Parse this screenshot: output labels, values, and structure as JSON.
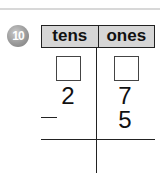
{
  "problem": {
    "number": "10",
    "headers": {
      "tens": "tens",
      "ones": "ones"
    },
    "rows": [
      {
        "tens": "",
        "ones": "",
        "type": "answer-boxes"
      },
      {
        "tens": "2",
        "ones": "7"
      },
      {
        "operator": "–",
        "tens": "",
        "ones": "5"
      }
    ],
    "operation": "subtraction"
  }
}
